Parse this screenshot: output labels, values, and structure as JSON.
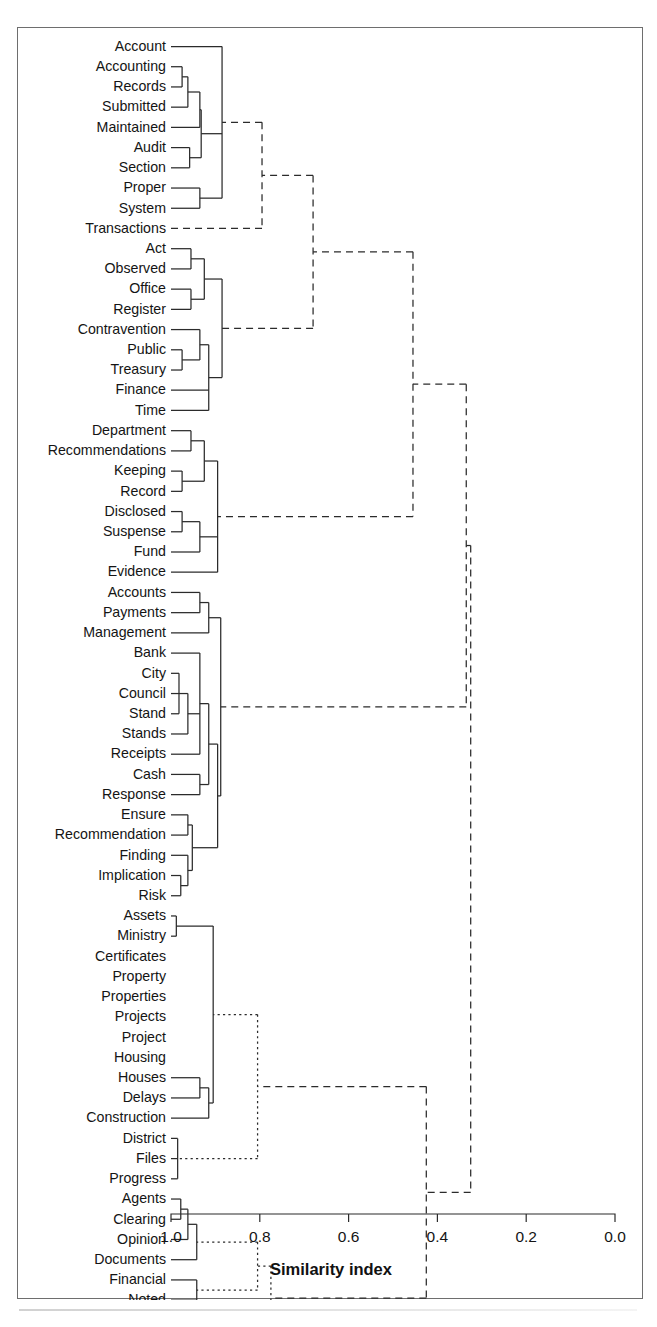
{
  "figure": {
    "type": "dendrogram",
    "axis_title": "Similarity index",
    "tick_labels": [
      "1.0",
      "0.8",
      "0.6",
      "0.4",
      "0.2",
      "0.0"
    ]
  },
  "chart_data": {
    "type": "dendrogram",
    "title": "",
    "xlabel": "Similarity index",
    "ylabel": "",
    "xlim": [
      1.0,
      0.0
    ],
    "xticks": [
      1.0,
      0.8,
      0.6,
      0.4,
      0.2,
      0.0
    ],
    "xtick_labels": [
      "1.0",
      "0.8",
      "0.6",
      "0.4",
      "0.2",
      "0.0"
    ],
    "grid": false,
    "legend": "none",
    "axis_direction": "reversed",
    "leaf_count": 54,
    "leaves": [
      "Account",
      "Accounting",
      "Records",
      "Submitted",
      "Maintained",
      "Audit",
      "Section",
      "Proper",
      "System",
      "Transactions",
      "Act",
      "Observed",
      "Office",
      "Register",
      "Contravention",
      "Public",
      "Treasury",
      "Finance",
      "Time",
      "Department",
      "Recommendations",
      "Keeping",
      "Record",
      "Disclosed",
      "Suspense",
      "Fund",
      "Evidence",
      "Accounts",
      "Payments",
      "Management",
      "Bank",
      "City",
      "Council",
      "Stand",
      "Stands",
      "Receipts",
      "Cash",
      "Response",
      "Ensure",
      "Recommendation",
      "Finding",
      "Implication",
      "Risk",
      "Assets",
      "Ministry",
      "Certificates",
      "Property",
      "Properties",
      "Projects",
      "Project",
      "Housing",
      "Houses",
      "Delays",
      "Construction",
      "District",
      "Files",
      "Progress",
      "Agents",
      "Clearing",
      "Opinion",
      "Documents",
      "Financial",
      "Noted",
      "Observation",
      "Statements"
    ],
    "merges": [
      {
        "id": "m1",
        "children": [
          "Accounting",
          "Records"
        ],
        "similarity": 0.975,
        "style": "solid"
      },
      {
        "id": "m2",
        "children": [
          "m1",
          "Submitted"
        ],
        "similarity": 0.962,
        "style": "solid"
      },
      {
        "id": "m3",
        "children": [
          "m2",
          "Maintained"
        ],
        "similarity": 0.935,
        "style": "solid"
      },
      {
        "id": "m4",
        "children": [
          "Audit",
          "Section"
        ],
        "similarity": 0.958,
        "style": "solid"
      },
      {
        "id": "m5",
        "children": [
          "m3",
          "m4"
        ],
        "similarity": 0.932,
        "style": "solid"
      },
      {
        "id": "m6",
        "children": [
          "Proper",
          "System"
        ],
        "similarity": 0.935,
        "style": "solid"
      },
      {
        "id": "m7",
        "children": [
          "Account",
          "m5",
          "m6"
        ],
        "similarity": 0.885,
        "style": "solid"
      },
      {
        "id": "m8",
        "children": [
          "m7",
          "Transactions"
        ],
        "similarity": 0.795,
        "style": "dashed"
      },
      {
        "id": "m9",
        "children": [
          "Act",
          "Observed"
        ],
        "similarity": 0.955,
        "style": "solid"
      },
      {
        "id": "m10",
        "children": [
          "Office",
          "Register"
        ],
        "similarity": 0.955,
        "style": "solid"
      },
      {
        "id": "m11",
        "children": [
          "m9",
          "m10"
        ],
        "similarity": 0.925,
        "style": "solid"
      },
      {
        "id": "m12",
        "children": [
          "Public",
          "Treasury"
        ],
        "similarity": 0.975,
        "style": "solid"
      },
      {
        "id": "m13",
        "children": [
          "Contravention",
          "m12"
        ],
        "similarity": 0.935,
        "style": "solid"
      },
      {
        "id": "m14",
        "children": [
          "m13",
          "Finance",
          "Time"
        ],
        "similarity": 0.915,
        "style": "solid"
      },
      {
        "id": "m15",
        "children": [
          "m11",
          "m14"
        ],
        "similarity": 0.885,
        "style": "solid"
      },
      {
        "id": "m16",
        "children": [
          "m8",
          "m15"
        ],
        "similarity": 0.68,
        "style": "dashed"
      },
      {
        "id": "m17",
        "children": [
          "Department",
          "Recommendations"
        ],
        "similarity": 0.955,
        "style": "solid"
      },
      {
        "id": "m18",
        "children": [
          "Keeping",
          "Record"
        ],
        "similarity": 0.975,
        "style": "solid"
      },
      {
        "id": "m19",
        "children": [
          "m17",
          "m18"
        ],
        "similarity": 0.925,
        "style": "solid"
      },
      {
        "id": "m20",
        "children": [
          "Disclosed",
          "Suspense"
        ],
        "similarity": 0.975,
        "style": "solid"
      },
      {
        "id": "m21",
        "children": [
          "m20",
          "Fund"
        ],
        "similarity": 0.935,
        "style": "solid"
      },
      {
        "id": "m22",
        "children": [
          "m19",
          "m21",
          "Evidence"
        ],
        "similarity": 0.895,
        "style": "solid"
      },
      {
        "id": "m23",
        "children": [
          "m22",
          "m16"
        ],
        "similarity": 0.455,
        "style": "dashed"
      },
      {
        "id": "m24",
        "children": [
          "Accounts",
          "Payments"
        ],
        "similarity": 0.935,
        "style": "solid"
      },
      {
        "id": "m25",
        "children": [
          "m24",
          "Management"
        ],
        "similarity": 0.915,
        "style": "solid"
      },
      {
        "id": "m26",
        "children": [
          "City",
          "Council",
          "Stand"
        ],
        "similarity": 0.982,
        "style": "solid"
      },
      {
        "id": "m27",
        "children": [
          "m26",
          "Stands"
        ],
        "similarity": 0.962,
        "style": "solid"
      },
      {
        "id": "m28",
        "children": [
          "Bank",
          "m27",
          "Receipts"
        ],
        "similarity": 0.935,
        "style": "solid"
      },
      {
        "id": "m29",
        "children": [
          "Cash",
          "Response"
        ],
        "similarity": 0.935,
        "style": "solid"
      },
      {
        "id": "m30",
        "children": [
          "m28",
          "m29"
        ],
        "similarity": 0.915,
        "style": "solid"
      },
      {
        "id": "m31",
        "children": [
          "Ensure",
          "Recommendation"
        ],
        "similarity": 0.962,
        "style": "solid"
      },
      {
        "id": "m32",
        "children": [
          "Implication",
          "Risk"
        ],
        "similarity": 0.978,
        "style": "solid"
      },
      {
        "id": "m33",
        "children": [
          "Finding",
          "m32"
        ],
        "similarity": 0.962,
        "style": "solid"
      },
      {
        "id": "m34",
        "children": [
          "m31",
          "m33"
        ],
        "similarity": 0.952,
        "style": "solid"
      },
      {
        "id": "m35",
        "children": [
          "m30",
          "m34"
        ],
        "similarity": 0.895,
        "style": "solid"
      },
      {
        "id": "m36",
        "children": [
          "m25",
          "m35"
        ],
        "similarity": 0.888,
        "style": "solid"
      },
      {
        "id": "m37",
        "children": [
          "m36",
          "m23"
        ],
        "similarity": 0.335,
        "style": "dashed"
      },
      {
        "id": "m38",
        "children": [
          "Assets",
          "Ministry"
        ],
        "similarity": 0.988,
        "style": "solid"
      },
      {
        "id": "m39",
        "children": [
          "Houses",
          "Delays"
        ],
        "similarity": 0.935,
        "style": "solid"
      },
      {
        "id": "m40",
        "children": [
          "m39",
          "Construction"
        ],
        "similarity": 0.915,
        "style": "solid"
      },
      {
        "id": "m41",
        "children": [
          "m38",
          "m40"
        ],
        "similarity": 0.905,
        "style": "solid"
      },
      {
        "id": "m42",
        "children": [
          "District",
          "Files",
          "Progress"
        ],
        "similarity": 0.985,
        "style": "solid"
      },
      {
        "id": "m43",
        "children": [
          "m41",
          "m42"
        ],
        "similarity": 0.805,
        "style": "dotted"
      },
      {
        "id": "m44",
        "children": [
          "Agents",
          "Clearing"
        ],
        "similarity": 0.978,
        "style": "solid"
      },
      {
        "id": "m45",
        "children": [
          "m44",
          "Opinion"
        ],
        "similarity": 0.962,
        "style": "solid"
      },
      {
        "id": "m46",
        "children": [
          "m45",
          "Documents"
        ],
        "similarity": 0.942,
        "style": "solid"
      },
      {
        "id": "m47",
        "children": [
          "Financial",
          "Noted"
        ],
        "similarity": 0.942,
        "style": "solid"
      },
      {
        "id": "m48",
        "children": [
          "m46",
          "m47"
        ],
        "similarity": 0.805,
        "style": "dotted"
      },
      {
        "id": "m49",
        "children": [
          "Observation",
          "Statements"
        ],
        "similarity": 0.935,
        "style": "solid"
      },
      {
        "id": "m50",
        "children": [
          "m48",
          "m49"
        ],
        "similarity": 0.775,
        "style": "dotted"
      },
      {
        "id": "m51",
        "children": [
          "m43",
          "m50"
        ],
        "similarity": 0.425,
        "style": "dashed"
      },
      {
        "id": "m52",
        "children": [
          "m37",
          "m51"
        ],
        "similarity": 0.325,
        "style": "dashed"
      }
    ]
  }
}
